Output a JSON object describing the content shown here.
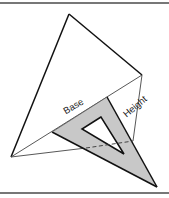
{
  "diagram": {
    "labels": {
      "base": "Base",
      "height": "Height"
    },
    "colors": {
      "background": "#ffffff",
      "border": "#777777",
      "outline": "#111111",
      "thin_line": "#444444",
      "set_square_fill": "#c8c8c8"
    },
    "triangle": {
      "top": [
        69,
        14
      ],
      "right": [
        142,
        75
      ],
      "left": [
        11,
        157
      ]
    },
    "set_square": {
      "outer": [
        [
          107,
          97
        ],
        [
          52,
          132
        ],
        [
          157,
          187
        ]
      ],
      "inner_hole": [
        [
          101,
          117
        ],
        [
          82,
          129
        ],
        [
          124,
          154
        ]
      ]
    },
    "height_line": {
      "from": [
        142,
        75
      ],
      "to": [
        133,
        141
      ]
    },
    "dashed_line": {
      "from": [
        86,
        148
      ],
      "to": [
        133,
        141
      ]
    }
  }
}
